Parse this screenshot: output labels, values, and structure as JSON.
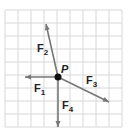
{
  "diagram": {
    "type": "force-vector-diagram",
    "grid": {
      "x0": 5,
      "y0": 10,
      "spacing": 13,
      "cols": 9,
      "rows": 9,
      "color": "#d8d8d8"
    },
    "point": {
      "label": "P",
      "x": 58,
      "y": 77
    },
    "vectors": [
      {
        "name": "F",
        "sub": "1",
        "x2": 25,
        "y2": 77,
        "lx": 34,
        "ly": 92
      },
      {
        "name": "F",
        "sub": "2",
        "x2": 46,
        "y2": 24,
        "lx": 37,
        "ly": 52
      },
      {
        "name": "F",
        "sub": "3",
        "x2": 109,
        "y2": 102,
        "lx": 86,
        "ly": 84
      },
      {
        "name": "F",
        "sub": "4",
        "x2": 58,
        "y2": 127,
        "lx": 62,
        "ly": 109
      }
    ],
    "colors": {
      "vector": "#777777",
      "point": "#111111",
      "text": "#222222"
    }
  }
}
